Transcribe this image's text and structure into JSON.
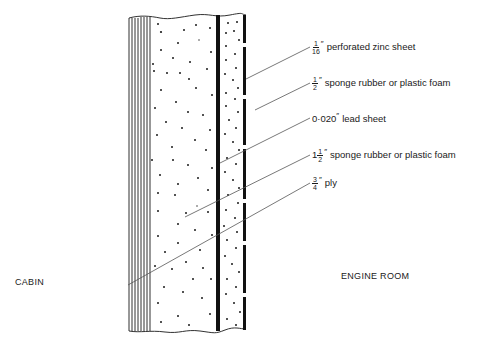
{
  "diagram": {
    "rooms": {
      "left": "CABIN",
      "right": "ENGINE ROOM"
    },
    "layers": [
      {
        "id": "zinc",
        "whole": "",
        "num": "1",
        "den": "16",
        "unit": "″",
        "text": "perforated zinc sheet",
        "pointer": [
          246,
          79
        ],
        "label_xy": [
          312,
          47
        ]
      },
      {
        "id": "sponge-half",
        "whole": "",
        "num": "1",
        "den": "2",
        "unit": "″",
        "text": "sponge rubber or plastic foam",
        "pointer": [
          255,
          110
        ],
        "label_xy": [
          312,
          83
        ]
      },
      {
        "id": "lead",
        "whole": "0·020",
        "num": "",
        "den": "",
        "unit": "″",
        "text": "lead sheet",
        "pointer": [
          220,
          163
        ],
        "label_xy": [
          312,
          118
        ]
      },
      {
        "id": "sponge-one-half",
        "whole": "1",
        "num": "1",
        "den": "2",
        "unit": "″",
        "text": "sponge rubber or plastic foam",
        "pointer": [
          185,
          217
        ],
        "label_xy": [
          312,
          155
        ]
      },
      {
        "id": "ply",
        "whole": "",
        "num": "3",
        "den": "4",
        "unit": "″",
        "text": "ply",
        "pointer": [
          128,
          285
        ],
        "label_xy": [
          312,
          183
        ]
      }
    ],
    "colors": {
      "ink": "#1a1a1a",
      "leader": "#555555",
      "background": "#ffffff"
    }
  }
}
